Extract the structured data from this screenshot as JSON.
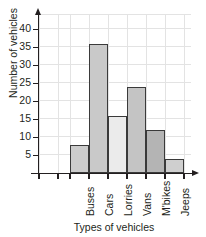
{
  "chart_data": {
    "type": "bar",
    "title": "",
    "subtitle": "",
    "xlabel": "Types of vehicles",
    "ylabel": "Number of vehicles",
    "categories": [
      "Buses",
      "Cars",
      "Lorries",
      "Vans",
      "M'bikes",
      "Jeeps"
    ],
    "values": [
      8,
      36,
      16,
      24,
      12,
      4
    ],
    "ylim": [
      0,
      42
    ],
    "yticks": [
      5,
      10,
      15,
      20,
      25,
      30,
      35,
      40
    ],
    "ytick_labels": [
      "5",
      "10",
      "15",
      "20",
      "25",
      "30",
      "35",
      "40"
    ],
    "grid": true,
    "legend": "none",
    "bar_colors": [
      "#cccccc",
      "#c9c9c9",
      "#ebebeb",
      "#c4c4c4",
      "#b4b4b4",
      "#cfcfcf"
    ],
    "bar_edge_color": "#3a3a3a",
    "axis_color": "#231f20",
    "grid_color": "#e3e3e3",
    "background": "#ffffff"
  }
}
